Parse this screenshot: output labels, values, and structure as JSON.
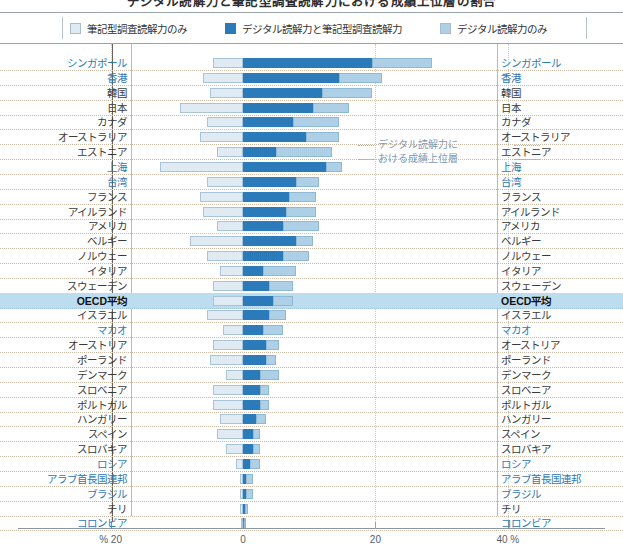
{
  "title": "デジタル読解力と筆記型調査読解力における成績上位層の割合",
  "legend": {
    "position": "top",
    "items": [
      {
        "label": "筆記型調査読解力のみ",
        "color": "#dfeaf2",
        "key": "print_only"
      },
      {
        "label": "デジタル読解力と筆記型調査読解力",
        "color": "#2b7bba",
        "key": "both"
      },
      {
        "label": "デジタル読解力のみ",
        "color": "#aed0e6",
        "key": "digital_only"
      }
    ]
  },
  "annotation": {
    "line1": "デジタル読解力に",
    "line2": "おける成績上位層"
  },
  "axis": {
    "ticks": [
      {
        "value": -20,
        "label": "% 20"
      },
      {
        "value": 0,
        "label": "0"
      },
      {
        "value": 20,
        "label": "20"
      },
      {
        "value": 40,
        "label": "40 %"
      }
    ],
    "min": -22,
    "max": 44,
    "gridlines": [
      -20,
      20,
      40
    ]
  },
  "chart_data": {
    "type": "bar",
    "orientation": "horizontal-diverging",
    "title": "デジタル読解力と筆記型調査読解力における成績上位層の割合",
    "xlabel": "%",
    "ylabel": "",
    "xlim": [
      -22,
      44
    ],
    "grid": true,
    "series": [
      {
        "name": "筆記型調査読解力のみ",
        "color": "#dfeaf2",
        "key": "print_only"
      },
      {
        "name": "デジタル読解力と筆記型調査読解力",
        "color": "#2b7bba",
        "key": "both"
      },
      {
        "name": "デジタル読解力のみ",
        "color": "#aed0e6",
        "key": "digital_only"
      }
    ],
    "categories": [
      "シンガポール",
      "香港",
      "韓国",
      "日本",
      "カナダ",
      "オーストラリア",
      "エストニア",
      "上海",
      "台湾",
      "フランス",
      "アイルランド",
      "アメリカ",
      "ベルギー",
      "ノルウェー",
      "イタリア",
      "スウェーデン",
      "OECD平均",
      "イスラエル",
      "マカオ",
      "オーストリア",
      "ポーランド",
      "デンマーク",
      "スロベニア",
      "ポルトガル",
      "ハンガリー",
      "スペイン",
      "スロバキア",
      "ロシア",
      "アラブ首長国連邦",
      "ブラジル",
      "チリ",
      "コロンビア"
    ],
    "rows": [
      {
        "name": "シンガポール",
        "non_oecd": true,
        "highlight": false,
        "print_only": 4.5,
        "both": 19.5,
        "digital_only": 9.0
      },
      {
        "name": "香港",
        "non_oecd": true,
        "highlight": false,
        "print_only": 6.0,
        "both": 14.5,
        "digital_only": 6.5
      },
      {
        "name": "韓国",
        "non_oecd": false,
        "highlight": false,
        "print_only": 5.0,
        "both": 12.0,
        "digital_only": 7.5
      },
      {
        "name": "日本",
        "non_oecd": false,
        "highlight": false,
        "print_only": 9.5,
        "both": 10.5,
        "digital_only": 5.5
      },
      {
        "name": "カナダ",
        "non_oecd": false,
        "highlight": false,
        "print_only": 5.5,
        "both": 7.5,
        "digital_only": 7.0
      },
      {
        "name": "オーストラリア",
        "non_oecd": false,
        "highlight": false,
        "print_only": 6.5,
        "both": 9.5,
        "digital_only": 5.0
      },
      {
        "name": "エストニア",
        "non_oecd": false,
        "highlight": false,
        "print_only": 4.0,
        "both": 5.0,
        "digital_only": 8.5
      },
      {
        "name": "上海",
        "non_oecd": true,
        "highlight": false,
        "print_only": 12.5,
        "both": 12.5,
        "digital_only": 2.5
      },
      {
        "name": "台湾",
        "non_oecd": true,
        "highlight": false,
        "print_only": 5.5,
        "both": 8.0,
        "digital_only": 3.5
      },
      {
        "name": "フランス",
        "non_oecd": false,
        "highlight": false,
        "print_only": 6.5,
        "both": 7.0,
        "digital_only": 4.0
      },
      {
        "name": "アイルランド",
        "non_oecd": false,
        "highlight": false,
        "print_only": 6.0,
        "both": 6.5,
        "digital_only": 4.5
      },
      {
        "name": "アメリカ",
        "non_oecd": false,
        "highlight": false,
        "print_only": 4.0,
        "both": 6.0,
        "digital_only": 5.5
      },
      {
        "name": "ベルギー",
        "non_oecd": false,
        "highlight": false,
        "print_only": 8.0,
        "both": 8.0,
        "digital_only": 2.5
      },
      {
        "name": "ノルウェー",
        "non_oecd": false,
        "highlight": false,
        "print_only": 5.5,
        "both": 6.0,
        "digital_only": 4.0
      },
      {
        "name": "イタリア",
        "non_oecd": false,
        "highlight": false,
        "print_only": 3.5,
        "both": 3.0,
        "digital_only": 5.0
      },
      {
        "name": "スウェーデン",
        "non_oecd": false,
        "highlight": false,
        "print_only": 4.5,
        "both": 4.0,
        "digital_only": 3.5
      },
      {
        "name": "OECD平均",
        "non_oecd": false,
        "highlight": true,
        "print_only": 4.5,
        "both": 4.5,
        "digital_only": 3.0
      },
      {
        "name": "イスラエル",
        "non_oecd": false,
        "highlight": false,
        "print_only": 5.5,
        "both": 4.0,
        "digital_only": 2.5
      },
      {
        "name": "マカオ",
        "non_oecd": true,
        "highlight": false,
        "print_only": 3.0,
        "both": 3.0,
        "digital_only": 3.0
      },
      {
        "name": "オーストリア",
        "non_oecd": false,
        "highlight": false,
        "print_only": 4.5,
        "both": 3.5,
        "digital_only": 2.0
      },
      {
        "name": "ポーランド",
        "non_oecd": false,
        "highlight": false,
        "print_only": 5.0,
        "both": 3.5,
        "digital_only": 1.5
      },
      {
        "name": "デンマーク",
        "non_oecd": false,
        "highlight": false,
        "print_only": 2.5,
        "both": 2.5,
        "digital_only": 3.0
      },
      {
        "name": "スロベニア",
        "non_oecd": false,
        "highlight": false,
        "print_only": 4.5,
        "both": 2.5,
        "digital_only": 1.5
      },
      {
        "name": "ポルトガル",
        "non_oecd": false,
        "highlight": false,
        "print_only": 4.5,
        "both": 2.5,
        "digital_only": 1.5
      },
      {
        "name": "ハンガリー",
        "non_oecd": false,
        "highlight": false,
        "print_only": 3.5,
        "both": 2.0,
        "digital_only": 1.5
      },
      {
        "name": "スペイン",
        "non_oecd": false,
        "highlight": false,
        "print_only": 4.0,
        "both": 1.5,
        "digital_only": 1.0
      },
      {
        "name": "スロバキア",
        "non_oecd": false,
        "highlight": false,
        "print_only": 2.5,
        "both": 1.5,
        "digital_only": 1.0
      },
      {
        "name": "ロシア",
        "non_oecd": true,
        "highlight": false,
        "print_only": 1.0,
        "both": 1.0,
        "digital_only": 1.5
      },
      {
        "name": "アラブ首長国連邦",
        "non_oecd": true,
        "highlight": false,
        "print_only": 0.5,
        "both": 0.5,
        "digital_only": 1.0
      },
      {
        "name": "ブラジル",
        "non_oecd": true,
        "highlight": false,
        "print_only": 0.5,
        "both": 0.5,
        "digital_only": 1.0
      },
      {
        "name": "チリ",
        "non_oecd": false,
        "highlight": false,
        "print_only": 0.5,
        "both": 0.3,
        "digital_only": 0.5
      },
      {
        "name": "コロンビア",
        "non_oecd": true,
        "highlight": false,
        "print_only": 0.3,
        "both": 0.2,
        "digital_only": 0.2
      }
    ]
  }
}
